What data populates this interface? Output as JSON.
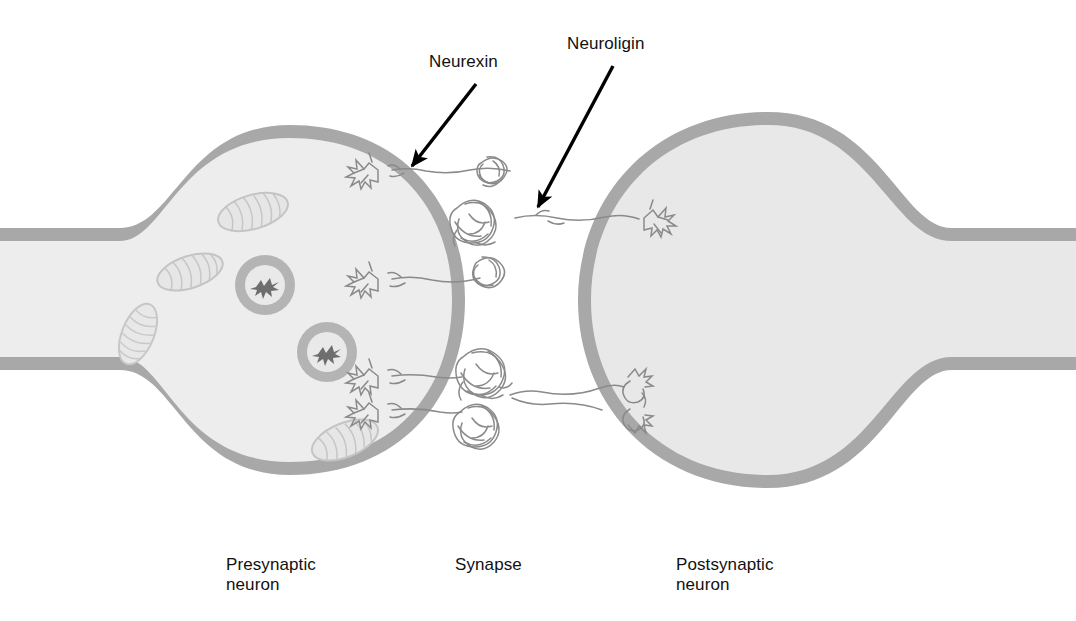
{
  "figure": {
    "background_color": "#ffffff"
  },
  "colors": {
    "membrane": "#a8a8a8",
    "cytoplasm": "#ededed",
    "cytoplasm_post": "#e8e8e8",
    "cleft": "#ffffff",
    "protein": "#8c8c8c",
    "organelle_outline": "#c9c9c9",
    "vesicle_ring": "#b4b4b4",
    "arrow": "#000000",
    "text": "#111111"
  },
  "labels": {
    "neurexin": "Neurexin",
    "neuroligin": "Neuroligin",
    "presynaptic": "Presynaptic\nneuron",
    "synapse": "Synapse",
    "postsynaptic": "Postsynaptic\nneuron"
  },
  "annotations": [
    {
      "id": "neurexin",
      "text": "Neurexin",
      "label_x": 429,
      "label_y": 52,
      "arrow_from": [
        476,
        84
      ],
      "arrow_to": [
        408,
        170
      ]
    },
    {
      "id": "neuroligin",
      "text": "Neuroligin",
      "label_x": 567,
      "label_y": 34,
      "arrow_from": [
        613,
        66
      ],
      "arrow_to": [
        534,
        211
      ]
    }
  ],
  "structures": {
    "presynaptic_terminal": {
      "name": "Presynaptic neuron",
      "shaft_y_top": 228,
      "shaft_y_bottom": 370,
      "bulb_center": [
        290,
        300
      ],
      "bulb_rx": 175,
      "bulb_ry": 180,
      "membrane_thickness": 13
    },
    "postsynaptic_terminal": {
      "name": "Postsynaptic neuron",
      "shaft_y_top": 228,
      "shaft_y_bottom": 370,
      "bulb_center": [
        770,
        300
      ],
      "bulb_rx": 200,
      "bulb_ry": 190,
      "membrane_thickness": 13
    },
    "synaptic_cleft": {
      "name": "Synapse",
      "x_left": 470,
      "x_right": 570
    }
  },
  "organelles": {
    "mitochondria": [
      {
        "cx": 253,
        "cy": 212,
        "rx": 36,
        "ry": 17,
        "rotate": -16
      },
      {
        "cx": 190,
        "cy": 272,
        "rx": 34,
        "ry": 16,
        "rotate": -18
      },
      {
        "cx": 138,
        "cy": 334,
        "rx": 16,
        "ry": 32,
        "rotate": 22
      },
      {
        "cx": 345,
        "cy": 440,
        "rx": 35,
        "ry": 17,
        "rotate": -22
      }
    ],
    "vesicles": [
      {
        "cx": 265,
        "cy": 285,
        "r_outer": 30,
        "r_inner": 20
      },
      {
        "cx": 327,
        "cy": 352,
        "r_outer": 30,
        "r_inner": 20
      }
    ]
  },
  "protein_complexes": {
    "count": 5,
    "description": "Tangled globular protein domains spanning the synaptic cleft",
    "presynaptic_attachment_y": [
      171,
      279,
      376,
      410
    ],
    "postsynaptic_attachment_y": [
      218,
      381,
      408
    ]
  }
}
